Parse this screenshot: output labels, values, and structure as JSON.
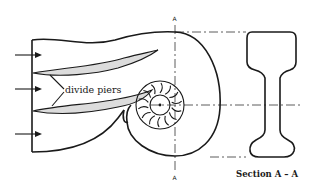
{
  "diagram": {
    "labels": {
      "piers": "divide piers",
      "section_title": "Section A – A",
      "cut_top": "A",
      "cut_bottom": "A"
    },
    "components": [
      "inlet-arrows",
      "intake-housing",
      "divide-piers",
      "spiral-casing",
      "impeller",
      "section-profile"
    ],
    "inlet_arrow_count": 3,
    "impeller_blade_count": 14,
    "colors": {
      "line": "#1a1a1a",
      "pier_fill": "#dcdcdc",
      "background": "#ffffff"
    }
  }
}
